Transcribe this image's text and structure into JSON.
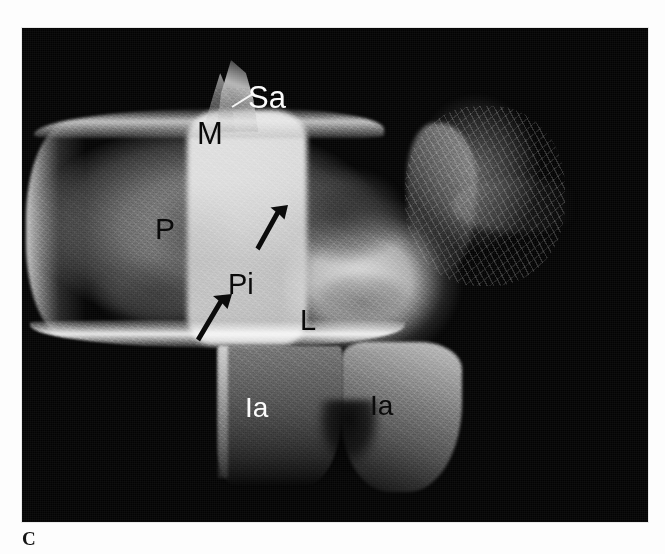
{
  "figure": {
    "panel_letter": "C",
    "modality": "radiograph",
    "view": "oblique / lateral"
  },
  "plate": {
    "background_color": "#030303",
    "page_background_color": "#fcfcfc",
    "left": 22,
    "top": 28,
    "width": 626,
    "height": 494
  },
  "annotations": {
    "labels": [
      {
        "id": "sa",
        "text": "Sa",
        "color": "#fbfbfb",
        "meaning": "superior articular process"
      },
      {
        "id": "m",
        "text": "M",
        "color": "#0a0a0a",
        "meaning": "mamillary process"
      },
      {
        "id": "p",
        "text": "P",
        "color": "#0a0a0a",
        "meaning": "pedicle"
      },
      {
        "id": "pi",
        "text": "Pi",
        "color": "#0a0a0a",
        "meaning": "pars interarticularis"
      },
      {
        "id": "l",
        "text": "L",
        "color": "#0a0a0a",
        "meaning": "lamina"
      },
      {
        "id": "ia_left",
        "text": "Ia",
        "color": "#fbfbfb",
        "meaning": "inferior articular process"
      },
      {
        "id": "ia_right",
        "text": "Ia",
        "color": "#0a0a0a",
        "meaning": "inferior articular process"
      }
    ],
    "arrows": [
      {
        "id": "arrow_upper",
        "color": "#0a0a0a",
        "direction": "up-right"
      },
      {
        "id": "arrow_lower",
        "color": "#0a0a0a",
        "direction": "up-right"
      }
    ],
    "leader_lines": [
      {
        "id": "sa_leader",
        "color": "#f4f4f4",
        "from_label": "Sa"
      }
    ]
  }
}
